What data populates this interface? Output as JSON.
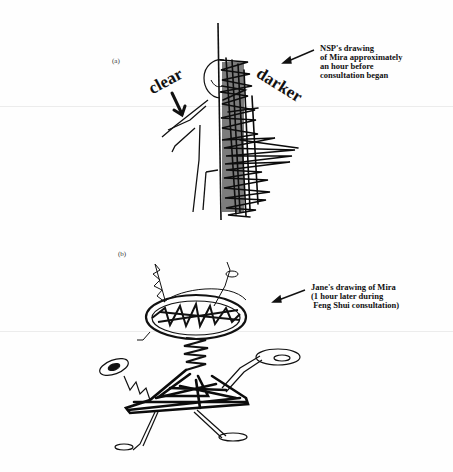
{
  "figure": {
    "panels": [
      {
        "id": "a",
        "label": "(a)",
        "caption": "NSP's drawing\nof Mira approximately\nan hour before\nconsultation began",
        "annotations": {
          "left": "clear",
          "right": "darker"
        },
        "drawing": "stick figure of Mira, left half outlined (clear), right half heavily scribbled black (darker)"
      },
      {
        "id": "b",
        "label": "(b)",
        "caption": "Jane's drawing of Mira\n(1 hour later during\n Feng Shui consultation)",
        "drawing": "scribbled figure with large oval disc head, coiled antennae, spring neck, triangular scribbled body, extended arms with oval hands, thin legs"
      }
    ]
  }
}
